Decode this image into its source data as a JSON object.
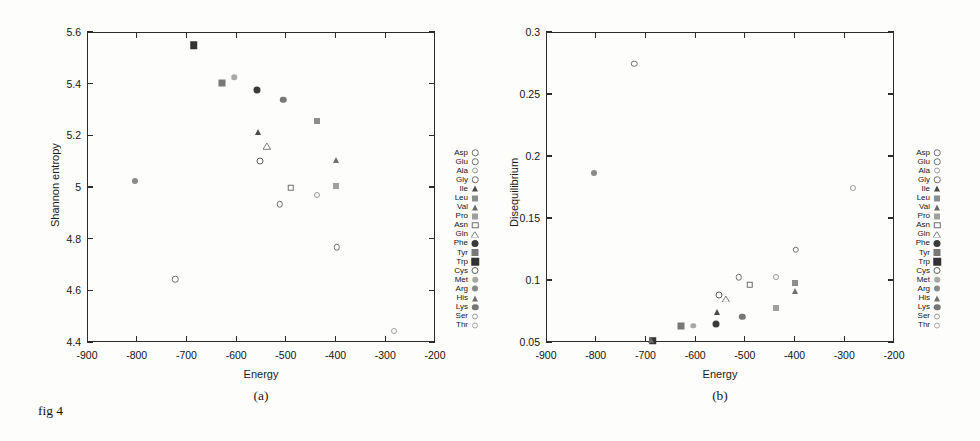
{
  "figure": {
    "caption": "fig 4"
  },
  "legend_series": [
    {
      "name": "Asp",
      "marker": "circle-open",
      "color": "#6f6f6f",
      "size": 6.5
    },
    {
      "name": "Glu",
      "marker": "circle-open",
      "color": "#6f6f6f",
      "size": 6.5
    },
    {
      "name": "Ala",
      "marker": "circle-open",
      "color": "#9a9a9a",
      "size": 6.0
    },
    {
      "name": "Gly",
      "marker": "circle-open",
      "color": "#6f6f6f",
      "size": 6.5
    },
    {
      "name": "Ile",
      "marker": "triangle-fill",
      "color": "#4a4a4a",
      "size": 6.5
    },
    {
      "name": "Leu",
      "marker": "square-fill",
      "color": "#8d8d8d",
      "size": 6.0
    },
    {
      "name": "Val",
      "marker": "triangle-fill",
      "color": "#6a6a6a",
      "size": 6.5
    },
    {
      "name": "Pro",
      "marker": "square-fill",
      "color": "#a0a0a0",
      "size": 6.0
    },
    {
      "name": "Asn",
      "marker": "square-open",
      "color": "#6f6f6f",
      "size": 6.5
    },
    {
      "name": "Gln",
      "marker": "triangle-open",
      "color": "#7d7d7d",
      "size": 6.5
    },
    {
      "name": "Phe",
      "marker": "circle-fill",
      "color": "#3a3a3a",
      "size": 7.0
    },
    {
      "name": "Tyr",
      "marker": "square-fill",
      "color": "#787878",
      "size": 7.0
    },
    {
      "name": "Trp",
      "marker": "square-fill",
      "color": "#333333",
      "size": 7.5
    },
    {
      "name": "Cys",
      "marker": "circle-open",
      "color": "#5c5c5c",
      "size": 7.0
    },
    {
      "name": "Met",
      "marker": "circle-fill",
      "color": "#a8a8a8",
      "size": 5.5
    },
    {
      "name": "Arg",
      "marker": "circle-fill",
      "color": "#8a8a8a",
      "size": 6.0
    },
    {
      "name": "His",
      "marker": "triangle-fill",
      "color": "#707070",
      "size": 6.5
    },
    {
      "name": "Lys",
      "marker": "circle-fill",
      "color": "#777777",
      "size": 6.5
    },
    {
      "name": "Ser",
      "marker": "circle-open",
      "color": "#9d9d9d",
      "size": 6.0
    },
    {
      "name": "Thr",
      "marker": "circle-open",
      "color": "#a5a5a5",
      "size": 6.0
    }
  ],
  "chart_data": [
    {
      "type": "scatter",
      "panel": "(a)",
      "title": "",
      "xlabel": "Energy",
      "ylabel": "Shannon entropy",
      "xlim": [
        -900,
        -200
      ],
      "ylim": [
        4.4,
        5.6
      ],
      "xticks": [
        -900,
        -800,
        -700,
        -600,
        -500,
        -400,
        -300,
        -200
      ],
      "yticks": [
        5.6,
        5.4,
        5.2,
        5,
        4.8,
        4.6,
        4.4
      ],
      "ytick_labels": [
        "5.6",
        "5.4",
        "5.2",
        "5",
        "4.8",
        "4.6",
        "4.4"
      ],
      "xtick_labels": [
        "-900",
        "-800",
        "-700",
        "-600",
        "-500",
        "-400",
        "-300",
        "-200"
      ],
      "grid": false,
      "legend_position": "right-outside",
      "points": [
        {
          "label": "Trp",
          "x": -685,
          "y": 5.548
        },
        {
          "label": "Tyr",
          "x": -628,
          "y": 5.401
        },
        {
          "label": "Met",
          "x": -604,
          "y": 5.425
        },
        {
          "label": "Phe",
          "x": -558,
          "y": 5.376
        },
        {
          "label": "Lys",
          "x": -505,
          "y": 5.338
        },
        {
          "label": "Leu",
          "x": -437,
          "y": 5.255
        },
        {
          "label": "Ile",
          "x": -557,
          "y": 5.212
        },
        {
          "label": "Gln",
          "x": -538,
          "y": 5.158
        },
        {
          "label": "Cys",
          "x": -552,
          "y": 5.1
        },
        {
          "label": "His",
          "x": -400,
          "y": 5.105
        },
        {
          "label": "Arg",
          "x": -803,
          "y": 5.022
        },
        {
          "label": "Pro",
          "x": -399,
          "y": 5.003
        },
        {
          "label": "Asn",
          "x": -490,
          "y": 4.997
        },
        {
          "label": "Ala",
          "x": -437,
          "y": 4.968
        },
        {
          "label": "Gly",
          "x": -512,
          "y": 4.933
        },
        {
          "label": "Glu",
          "x": -398,
          "y": 4.766
        },
        {
          "label": "Asp",
          "x": -722,
          "y": 4.643
        },
        {
          "label": "Ser",
          "x": -283,
          "y": 4.443
        }
      ]
    },
    {
      "type": "scatter",
      "panel": "(b)",
      "title": "",
      "xlabel": "Energy",
      "ylabel": "Disequilibrium",
      "xlim": [
        -900,
        -200
      ],
      "ylim": [
        0.05,
        0.3
      ],
      "xticks": [
        -900,
        -800,
        -700,
        -600,
        -500,
        -400,
        -300,
        -200
      ],
      "yticks": [
        0.3,
        0.25,
        0.2,
        0.15,
        0.1,
        0.05
      ],
      "ytick_labels": [
        "0.3",
        "0.25",
        "0.2",
        "0.15",
        "0.1",
        "0.05"
      ],
      "xtick_labels": [
        "-900",
        "-800",
        "-700",
        "-600",
        "-500",
        "-400",
        "-300",
        "-200"
      ],
      "grid": false,
      "legend_position": "right-outside",
      "points": [
        {
          "label": "Asp",
          "x": -722,
          "y": 0.2745
        },
        {
          "label": "Arg",
          "x": -803,
          "y": 0.1862
        },
        {
          "label": "Ser",
          "x": -283,
          "y": 0.1738
        },
        {
          "label": "Glu",
          "x": -398,
          "y": 0.1243
        },
        {
          "label": "Gly",
          "x": -512,
          "y": 0.1023
        },
        {
          "label": "Ala",
          "x": -437,
          "y": 0.1025
        },
        {
          "label": "Leu",
          "x": -400,
          "y": 0.0972
        },
        {
          "label": "Asn",
          "x": -490,
          "y": 0.096
        },
        {
          "label": "His",
          "x": -400,
          "y": 0.0913
        },
        {
          "label": "Cys",
          "x": -552,
          "y": 0.088
        },
        {
          "label": "Gln",
          "x": -538,
          "y": 0.0848
        },
        {
          "label": "Pro",
          "x": -437,
          "y": 0.0777
        },
        {
          "label": "Ile",
          "x": -557,
          "y": 0.0745
        },
        {
          "label": "Lys",
          "x": -505,
          "y": 0.0702
        },
        {
          "label": "Tyr",
          "x": -628,
          "y": 0.0628
        },
        {
          "label": "Met",
          "x": -604,
          "y": 0.0631
        },
        {
          "label": "Phe",
          "x": -558,
          "y": 0.0645
        },
        {
          "label": "Trp",
          "x": -685,
          "y": 0.051
        },
        {
          "label": "Val",
          "x": -688,
          "y": 0.0513
        }
      ]
    }
  ]
}
